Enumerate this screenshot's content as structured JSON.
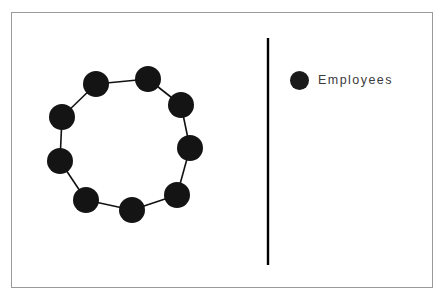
{
  "canvas": {
    "width": 444,
    "height": 305,
    "background_color": "#ffffff"
  },
  "frame": {
    "border_color": "#9a9a9a",
    "x": 11,
    "y": 12,
    "width": 422,
    "height": 276
  },
  "top_artifact": {
    "text": "\"",
    "color": "#b9b9b9"
  },
  "divider": {
    "color": "#000000",
    "x": 268,
    "y_start": 38,
    "y_end": 265,
    "thickness": 2.4
  },
  "legend": {
    "marker_shape": "circle",
    "marker_color": "#1a1a1a",
    "label": "Employees",
    "label_color": "#3b3b3b"
  },
  "chart_data": {
    "type": "scatter",
    "title": "",
    "xlabel": "",
    "ylabel": "",
    "graph_type": "ring-network",
    "node_color": "#141414",
    "edge_color": "#111111",
    "node_radius": 13,
    "edge_width": 1.6,
    "node_count": 9,
    "edge_count": 9,
    "center": [
      123,
      143
    ],
    "ring_radius": 62,
    "legend_entries": [
      "Employees"
    ],
    "nodes": [
      {
        "id": 1,
        "label": "",
        "x": 96,
        "y": 84
      },
      {
        "id": 2,
        "label": "",
        "x": 148,
        "y": 79
      },
      {
        "id": 3,
        "label": "",
        "x": 181,
        "y": 105
      },
      {
        "id": 4,
        "label": "",
        "x": 190,
        "y": 148
      },
      {
        "id": 5,
        "label": "",
        "x": 177,
        "y": 195
      },
      {
        "id": 6,
        "label": "",
        "x": 132,
        "y": 210
      },
      {
        "id": 7,
        "label": "",
        "x": 86,
        "y": 200
      },
      {
        "id": 8,
        "label": "",
        "x": 60,
        "y": 161
      },
      {
        "id": 9,
        "label": "",
        "x": 62,
        "y": 117
      }
    ],
    "edges": [
      [
        1,
        2
      ],
      [
        2,
        3
      ],
      [
        3,
        4
      ],
      [
        4,
        5
      ],
      [
        5,
        6
      ],
      [
        6,
        7
      ],
      [
        7,
        8
      ],
      [
        8,
        9
      ],
      [
        9,
        1
      ]
    ]
  }
}
